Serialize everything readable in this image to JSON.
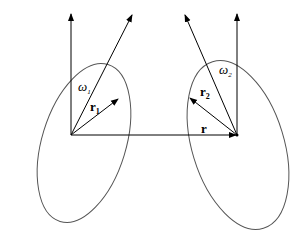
{
  "diagram": {
    "labels": {
      "omega1": "ω",
      "omega1_sub": "1",
      "r1": "r",
      "r1_sub": "1",
      "omega2": "ω",
      "omega2_sub": "2",
      "r2": "r",
      "r2_sub": "2",
      "r": "r"
    },
    "colors": {
      "stroke": "#000000",
      "ellipse": "#555555",
      "background": "#ffffff"
    }
  }
}
